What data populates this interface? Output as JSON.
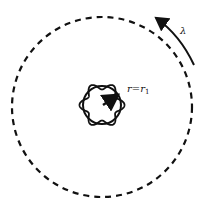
{
  "diagram": {
    "labels": {
      "radius": "r=r",
      "radius_sub": "1",
      "wavelength": "λ"
    },
    "colors": {
      "stroke": "#111111",
      "background": "#ffffff"
    },
    "outer_circle": {
      "cx": 102,
      "cy": 107,
      "r": 90,
      "style": "dashed"
    },
    "inner_circle": {
      "cx": 102,
      "cy": 105,
      "r": 19
    },
    "wavy_boundary": {
      "lobes": 6,
      "amplitude": 3.5
    }
  }
}
